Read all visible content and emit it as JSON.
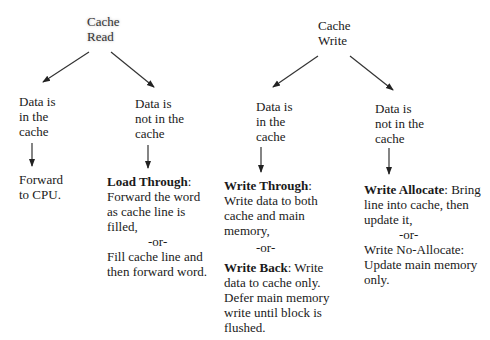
{
  "diagram": {
    "read": {
      "root": [
        "Cache",
        "Read"
      ],
      "hit": {
        "condition": [
          "Data is",
          "in the",
          "cache"
        ],
        "action": [
          "Forward",
          "to CPU."
        ]
      },
      "miss": {
        "condition": [
          "Data is",
          "not in the",
          "cache"
        ],
        "policy1_title": "Load Through",
        "policy1_lines": [
          "Forward the word",
          "as cache line is",
          "filled,"
        ],
        "or": "-or-",
        "policy2_lines": [
          "Fill cache line and",
          "then forward word."
        ]
      }
    },
    "write": {
      "root": [
        "Cache",
        "Write"
      ],
      "hit": {
        "condition": [
          "Data is",
          "in the",
          "cache"
        ],
        "policy1_title": "Write Through",
        "policy1_lines": [
          "Write data to both",
          "cache and main",
          "memory,"
        ],
        "or": "-or-",
        "policy2_title": "Write Back",
        "policy2_first": " Write",
        "policy2_lines": [
          "data to cache only.",
          "Defer main memory",
          "write until block is",
          "flushed."
        ]
      },
      "miss": {
        "condition": [
          "Data is",
          "not in the",
          "cache"
        ],
        "policy1_title": "Write Allocate",
        "policy1_first": " Bring",
        "policy1_lines": [
          "line into cache, then",
          "update it,"
        ],
        "or": "-or-",
        "policy2_lines": [
          "Write No-Allocate:",
          "Update main memory",
          "only."
        ]
      }
    }
  }
}
